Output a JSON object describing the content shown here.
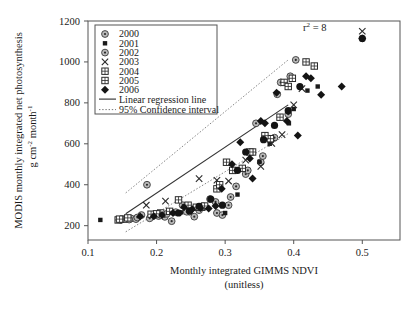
{
  "chart_data": {
    "type": "scatter",
    "title": "",
    "xlabel": "Monthly integrated GIMMS NDVI",
    "xlabel_sub": "(unitless)",
    "ylabel_line1": "MODIS monthly integrated net photosynthesis",
    "ylabel_line2": "g cm",
    "ylabel_line2_sup1": "-2",
    "ylabel_line2_mid": " month",
    "ylabel_line2_sup2": "-1",
    "xlim": [
      0.1,
      0.555
    ],
    "ylim": [
      130,
      1200
    ],
    "xticks": [
      0.1,
      0.2,
      0.3,
      0.4,
      0.5
    ],
    "xticklabels": [
      "0.1",
      "0.2",
      "0.3",
      "0.4",
      "0.5"
    ],
    "yticks": [
      200,
      400,
      600,
      800,
      1000,
      1200
    ],
    "yticklabels": [
      "200",
      "400",
      "600",
      "800",
      "1000",
      "1200"
    ],
    "grid": false,
    "annotation": "r",
    "annotation_sup": "2",
    "annotation_rest": " = 8",
    "legend_position": "top-left",
    "legend_entries": [
      {
        "label": "2000",
        "marker": "circle-gray-dot"
      },
      {
        "label": "2001",
        "marker": "small-filled-square"
      },
      {
        "label": "2002",
        "marker": "circle-gray-dot"
      },
      {
        "label": "2003",
        "marker": "cross-x"
      },
      {
        "label": "2004",
        "marker": "square-plus"
      },
      {
        "label": "2005",
        "marker": "square-plus"
      },
      {
        "label": "2006",
        "marker": "filled-diamond"
      }
    ],
    "legend_lines": [
      {
        "label": "Linear regression line",
        "style": "solid"
      },
      {
        "label": "95% Confidence interval",
        "style": "dotted"
      }
    ],
    "regression_line": {
      "x": [
        0.155,
        0.392
      ],
      "y": [
        258,
        790
      ]
    },
    "ci_upper": {
      "x": [
        0.155,
        0.392
      ],
      "y": [
        360,
        1010
      ]
    },
    "ci_lower": {
      "x": [
        0.155,
        0.392
      ],
      "y": [
        170,
        650
      ]
    },
    "series": [
      {
        "name": "2000",
        "marker": "circle-gray-dot",
        "points": [
          [
            0.148,
            228
          ],
          [
            0.163,
            235
          ],
          [
            0.17,
            232
          ],
          [
            0.178,
            252
          ],
          [
            0.186,
            400
          ],
          [
            0.196,
            250
          ],
          [
            0.203,
            247
          ],
          [
            0.212,
            243
          ],
          [
            0.222,
            222
          ],
          [
            0.238,
            300
          ],
          [
            0.248,
            268
          ],
          [
            0.255,
            244
          ],
          [
            0.268,
            295
          ],
          [
            0.278,
            330
          ],
          [
            0.288,
            262
          ],
          [
            0.296,
            252
          ],
          [
            0.305,
            300
          ],
          [
            0.316,
            392
          ],
          [
            0.33,
            452
          ],
          [
            0.345,
            700
          ],
          [
            0.352,
            510
          ],
          [
            0.366,
            620
          ],
          [
            0.376,
            842
          ],
          [
            0.381,
            900
          ],
          [
            0.395,
            930
          ],
          [
            0.403,
            1010
          ]
        ]
      },
      {
        "name": "2001",
        "marker": "small-filled-square",
        "points": [
          [
            0.118,
            228
          ],
          [
            0.149,
            230
          ],
          [
            0.236,
            265
          ],
          [
            0.3,
            262
          ],
          [
            0.318,
            352
          ],
          [
            0.35,
            512
          ],
          [
            0.365,
            600
          ],
          [
            0.393,
            700
          ],
          [
            0.4,
            770
          ],
          [
            0.42,
            860
          ],
          [
            0.435,
            880
          ]
        ]
      },
      {
        "name": "2002",
        "marker": "circle-gray-dot",
        "points": [
          [
            0.16,
            230
          ],
          [
            0.172,
            240
          ],
          [
            0.19,
            236
          ],
          [
            0.206,
            252
          ],
          [
            0.215,
            258
          ],
          [
            0.228,
            266
          ],
          [
            0.244,
            268
          ],
          [
            0.262,
            276
          ],
          [
            0.286,
            316
          ],
          [
            0.308,
            340
          ],
          [
            0.333,
            470
          ],
          [
            0.355,
            540
          ],
          [
            0.372,
            630
          ],
          [
            0.392,
            745
          ]
        ]
      },
      {
        "name": "2003",
        "marker": "cross-x",
        "points": [
          [
            0.185,
            300
          ],
          [
            0.213,
            320
          ],
          [
            0.262,
            430
          ],
          [
            0.288,
            422
          ],
          [
            0.305,
            418
          ],
          [
            0.33,
            520
          ],
          [
            0.352,
            490
          ],
          [
            0.368,
            602
          ],
          [
            0.383,
            645
          ],
          [
            0.4,
            790
          ],
          [
            0.412,
            870
          ],
          [
            0.5,
            1150
          ]
        ]
      },
      {
        "name": "2004",
        "marker": "square-plus",
        "points": [
          [
            0.144,
            228
          ],
          [
            0.152,
            232
          ],
          [
            0.192,
            256
          ],
          [
            0.206,
            262
          ],
          [
            0.232,
            326
          ],
          [
            0.258,
            290
          ],
          [
            0.266,
            290
          ],
          [
            0.288,
            380
          ],
          [
            0.302,
            510
          ],
          [
            0.325,
            480
          ],
          [
            0.34,
            560
          ],
          [
            0.366,
            625
          ],
          [
            0.386,
            900
          ],
          [
            0.392,
            880
          ],
          [
            0.418,
            1000
          ],
          [
            0.43,
            980
          ]
        ]
      },
      {
        "name": "2005",
        "marker": "square-plus",
        "points": [
          [
            0.146,
            232
          ],
          [
            0.158,
            238
          ],
          [
            0.2,
            258
          ],
          [
            0.219,
            270
          ],
          [
            0.246,
            300
          ],
          [
            0.27,
            296
          ],
          [
            0.292,
            400
          ],
          [
            0.311,
            470
          ],
          [
            0.336,
            560
          ],
          [
            0.358,
            640
          ],
          [
            0.38,
            730
          ],
          [
            0.398,
            920
          ]
        ]
      },
      {
        "name": "2006",
        "marker": "filled-diamond",
        "points": [
          [
            0.176,
            245
          ],
          [
            0.196,
            246
          ],
          [
            0.208,
            252
          ],
          [
            0.224,
            262
          ],
          [
            0.24,
            290
          ],
          [
            0.252,
            280
          ],
          [
            0.264,
            286
          ],
          [
            0.276,
            284
          ],
          [
            0.286,
            296
          ],
          [
            0.295,
            380
          ],
          [
            0.31,
            500
          ],
          [
            0.322,
            608
          ],
          [
            0.336,
            528
          ],
          [
            0.34,
            430
          ],
          [
            0.352,
            712
          ],
          [
            0.358,
            700
          ],
          [
            0.375,
            850
          ],
          [
            0.39,
            712
          ],
          [
            0.406,
            640
          ],
          [
            0.418,
            930
          ],
          [
            0.425,
            920
          ],
          [
            0.44,
            840
          ],
          [
            0.47,
            880
          ],
          [
            0.5,
            1115
          ]
        ]
      }
    ]
  }
}
